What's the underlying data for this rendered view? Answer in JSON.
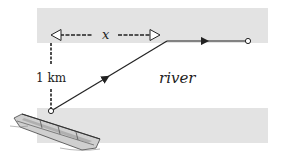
{
  "diagram": {
    "type": "river-crossing",
    "labels": {
      "distance_across": "x",
      "width": "1 km",
      "river": "river"
    },
    "colors": {
      "bank": "#e3e3e3",
      "line": "#222222",
      "background": "#ffffff"
    },
    "geometry": {
      "top_bank": {
        "x": 37,
        "y": 8,
        "w": 231,
        "h": 35
      },
      "bottom_bank": {
        "x": 37,
        "y": 108,
        "w": 231,
        "h": 35
      },
      "start_point": [
        51,
        111
      ],
      "bend_point": [
        167,
        41
      ],
      "end_point": [
        248,
        41
      ]
    },
    "elements": [
      {
        "name": "boat",
        "description": "rowboat on the near bank"
      },
      {
        "name": "path",
        "description": "diagonal row across the river then run along the far bank"
      }
    ]
  }
}
